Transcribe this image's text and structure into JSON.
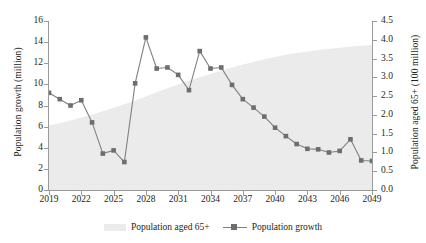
{
  "chart_data": {
    "type": "line",
    "title": "",
    "xlabel": "",
    "ylabel": "Population growth (million)",
    "y2label": "Population aged 65+ (100 million)",
    "x": [
      2019,
      2020,
      2021,
      2022,
      2023,
      2024,
      2025,
      2026,
      2027,
      2028,
      2029,
      2030,
      2031,
      2032,
      2033,
      2034,
      2035,
      2036,
      2037,
      2038,
      2039,
      2040,
      2041,
      2042,
      2043,
      2044,
      2045,
      2046,
      2047,
      2048,
      2049
    ],
    "xticks": [
      "2019",
      "2022",
      "2025",
      "2028",
      "2031",
      "2034",
      "2037",
      "2040",
      "2043",
      "2046",
      "2049"
    ],
    "yticks": [
      "0",
      "2",
      "4",
      "6",
      "8",
      "10",
      "12",
      "14",
      "16"
    ],
    "y2ticks": [
      "0.0",
      "0.5",
      "1.0",
      "1.5",
      "2.0",
      "2.5",
      "3.0",
      "3.5",
      "4.0",
      "4.5"
    ],
    "ylim": [
      0,
      16
    ],
    "y2lim": [
      0,
      4.5
    ],
    "xlim": [
      2019,
      2049
    ],
    "grid": false,
    "legend_position": "bottom",
    "series": [
      {
        "name": "Population aged 65+",
        "axis": "right",
        "style": "area",
        "color": "#ebebeb",
        "values": [
          1.72,
          1.78,
          1.85,
          1.93,
          2.01,
          2.1,
          2.19,
          2.28,
          2.38,
          2.49,
          2.6,
          2.71,
          2.81,
          2.91,
          3.0,
          3.09,
          3.18,
          3.26,
          3.34,
          3.41,
          3.48,
          3.54,
          3.6,
          3.65,
          3.69,
          3.73,
          3.76,
          3.79,
          3.82,
          3.84,
          3.86
        ]
      },
      {
        "name": "Population growth",
        "axis": "left",
        "style": "line-marker",
        "color": "#6e6e6e",
        "values": [
          9.2,
          8.6,
          8.0,
          8.5,
          6.4,
          3.45,
          3.75,
          2.65,
          10.1,
          14.45,
          11.5,
          11.6,
          10.9,
          9.45,
          13.15,
          11.5,
          11.6,
          9.95,
          8.6,
          7.8,
          6.95,
          5.9,
          5.1,
          4.35,
          3.9,
          3.85,
          3.55,
          3.7,
          4.8,
          2.8,
          2.75
        ]
      }
    ]
  },
  "legend": {
    "area_label": "Population aged 65+",
    "line_label": "Population growth"
  },
  "axes": {
    "left_title": "Population growth (million)",
    "right_title": "Population aged 65+ (100 million)"
  }
}
